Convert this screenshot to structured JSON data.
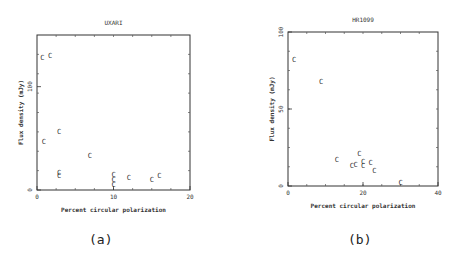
{
  "chart_data": [
    {
      "type": "scatter",
      "panel_label": "(a)",
      "title": "UXARI",
      "xlabel": "Percent circular polarization",
      "ylabel": "Flux density (mJy)",
      "xlim": [
        0,
        20
      ],
      "ylim": [
        0,
        150
      ],
      "xticks": [
        0,
        10,
        20
      ],
      "yticks": [
        0,
        100
      ],
      "marker": "C",
      "points": [
        {
          "x": 0.7,
          "y": 128
        },
        {
          "x": 1.7,
          "y": 130
        },
        {
          "x": 0.9,
          "y": 47
        },
        {
          "x": 2.9,
          "y": 57
        },
        {
          "x": 2.9,
          "y": 17
        },
        {
          "x": 2.9,
          "y": 14
        },
        {
          "x": 6.9,
          "y": 33
        },
        {
          "x": 10,
          "y": 15
        },
        {
          "x": 10,
          "y": 10
        },
        {
          "x": 10,
          "y": 5
        },
        {
          "x": 12,
          "y": 12
        },
        {
          "x": 15,
          "y": 10
        },
        {
          "x": 16,
          "y": 14
        }
      ]
    },
    {
      "type": "scatter",
      "panel_label": "(b)",
      "title": "HR1099",
      "xlabel": "Percent circular polarization",
      "ylabel": "Flux density (mJy)",
      "xlim": [
        0,
        40
      ],
      "ylim": [
        0,
        100
      ],
      "xticks": [
        0,
        20,
        40
      ],
      "yticks": [
        0,
        50,
        100
      ],
      "marker": "C",
      "points": [
        {
          "x": 1.6,
          "y": 82
        },
        {
          "x": 8.8,
          "y": 68
        },
        {
          "x": 13,
          "y": 17
        },
        {
          "x": 17,
          "y": 13
        },
        {
          "x": 18,
          "y": 14
        },
        {
          "x": 19,
          "y": 21
        },
        {
          "x": 20,
          "y": 16
        },
        {
          "x": 20,
          "y": 13
        },
        {
          "x": 22,
          "y": 15
        },
        {
          "x": 23,
          "y": 10
        },
        {
          "x": 30,
          "y": 2
        }
      ]
    }
  ]
}
